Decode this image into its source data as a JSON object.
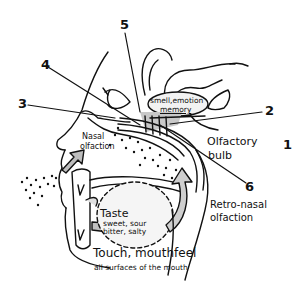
{
  "diagram": {
    "type": "anatomical-sketch",
    "colors": {
      "line": "#111111",
      "shade": "#c8c8c8",
      "light_shade": "#e6e6e6",
      "background": "#ffffff"
    },
    "numbers": [
      {
        "id": "1",
        "label": "1"
      },
      {
        "id": "2",
        "label": "2"
      },
      {
        "id": "3",
        "label": "3"
      },
      {
        "id": "4",
        "label": "4"
      },
      {
        "id": "5",
        "label": "5"
      },
      {
        "id": "6",
        "label": "6"
      }
    ],
    "labels": {
      "brain_region": [
        "smell,emotion",
        "memory"
      ],
      "olfactory_bulb": [
        "Olfactory",
        "bulb"
      ],
      "nasal": [
        "Nasal",
        "olfaction"
      ],
      "retronasal": [
        "Retro-nasal",
        "olfaction"
      ],
      "taste_title": "Taste",
      "taste_types": [
        "sweet, sour",
        "bitter, salty"
      ],
      "touch_title": "Touch, mouthfeel",
      "touch_sub": "all surfaces of the mouth"
    }
  }
}
